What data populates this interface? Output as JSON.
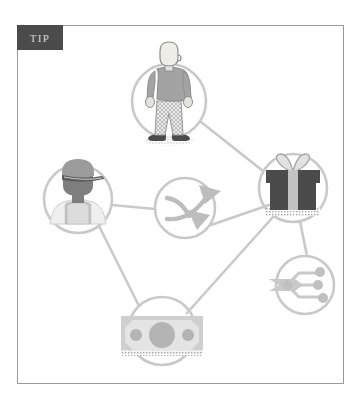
{
  "badge": {
    "label": "TIP"
  },
  "frame": {
    "border_color": "#9a9a9a",
    "background": "#ffffff"
  },
  "palette": {
    "badge_bg": "#4b4b4b",
    "badge_text": "#d6d6d6",
    "link_line": "#c9c9c9",
    "node_ring": "#c9c9c9",
    "icon_light": "#d8d8d8",
    "icon_mid": "#a8a8a8",
    "icon_dark": "#4b4b4b",
    "icon_outline": "#8e8e8e",
    "skin": "#f0ede8"
  },
  "diagram": {
    "type": "node-link",
    "nodes": [
      {
        "id": "standing-person",
        "icon_name": "standing-person-icon",
        "label": "Standing person",
        "cx": 152,
        "cy": 76,
        "r": 37
      },
      {
        "id": "worker-with-cap",
        "icon_name": "worker-with-cap-icon",
        "label": "Worker wearing cap and overalls",
        "cx": 61,
        "cy": 174,
        "r": 34
      },
      {
        "id": "shuffle-arrows",
        "icon_name": "shuffle-arrows-icon",
        "label": "Crossing arrows / exchange",
        "cx": 168,
        "cy": 183,
        "r": 30
      },
      {
        "id": "gift-box",
        "icon_name": "gift-box-icon",
        "label": "Gift box with bow",
        "cx": 276,
        "cy": 163,
        "r": 34
      },
      {
        "id": "network-share",
        "icon_name": "network-share-icon",
        "label": "Network share nodes",
        "cx": 288,
        "cy": 260,
        "r": 29
      },
      {
        "id": "banknote",
        "icon_name": "banknote-icon",
        "label": "Banknote / cash",
        "cx": 145,
        "cy": 306,
        "r": 34
      }
    ],
    "links": [
      {
        "from": "standing-person",
        "to": "gift-box"
      },
      {
        "from": "worker-with-cap",
        "to": "shuffle-arrows"
      },
      {
        "from": "shuffle-arrows",
        "to": "gift-box"
      },
      {
        "from": "worker-with-cap",
        "to": "banknote"
      },
      {
        "from": "banknote",
        "to": "gift-box"
      },
      {
        "from": "gift-box",
        "to": "network-share"
      }
    ]
  }
}
